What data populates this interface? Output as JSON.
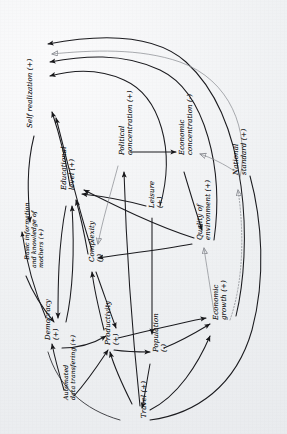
{
  "diagram": {
    "type": "causal-loop-diagram",
    "orientation": "labels rotated 90 degrees counter-clockwise",
    "ink_color": "#17171a",
    "paper_color": "#f1f2f4",
    "faint_ink_color": "#8e9096"
  },
  "nodes": [
    {
      "id": "self_realization",
      "label": "Self realization (+)",
      "polarity": "+",
      "x": 26,
      "y": 128
    },
    {
      "id": "basic_information",
      "label": "Basic information\nand knowledge of\nmothers (+)",
      "polarity": "+",
      "x": 16,
      "y": 268
    },
    {
      "id": "educational_level",
      "label": "Educational\nlevel (+)",
      "polarity": "+",
      "x": 60,
      "y": 190
    },
    {
      "id": "democracy",
      "label": "Democracy\n(+)",
      "polarity": "+",
      "x": 44,
      "y": 340
    },
    {
      "id": "automated_transfer",
      "label": "Automated\ndata transfering (+)",
      "polarity": "+",
      "x": 62,
      "y": 400
    },
    {
      "id": "complexity",
      "label": "Complexity\n(-)",
      "polarity": "-",
      "x": 88,
      "y": 262
    },
    {
      "id": "productivity",
      "label": "Productivity\n(+)",
      "polarity": "+",
      "x": 104,
      "y": 345
    },
    {
      "id": "political_conc",
      "label": "Political\nconcentration (+)",
      "polarity": "+",
      "x": 118,
      "y": 155
    },
    {
      "id": "leisure",
      "label": "Leisure\n(+)",
      "polarity": "+",
      "x": 148,
      "y": 208
    },
    {
      "id": "population",
      "label": "Population\n(-)",
      "polarity": "-",
      "x": 152,
      "y": 352
    },
    {
      "id": "travel",
      "label": "Travel (+)",
      "polarity": "+",
      "x": 140,
      "y": 418
    },
    {
      "id": "economic_conc",
      "label": "Economic\nconcentration (-)",
      "polarity": "-",
      "x": 178,
      "y": 155
    },
    {
      "id": "quality_env",
      "label": "Quality of\nenvironment (+)",
      "polarity": "+",
      "x": 196,
      "y": 240
    },
    {
      "id": "economic_growth",
      "label": "Economic\ngrowth (+)",
      "polarity": "+",
      "x": 212,
      "y": 320
    },
    {
      "id": "national_standard",
      "label": "National\nstandard (+)",
      "polarity": "+",
      "x": 232,
      "y": 175
    }
  ],
  "edges": [
    {
      "from": "educational_level",
      "to": "self_realization",
      "style": "solid"
    },
    {
      "from": "leisure",
      "to": "self_realization",
      "style": "solid"
    },
    {
      "from": "economic_growth",
      "to": "self_realization",
      "style": "solid"
    },
    {
      "from": "national_standard",
      "to": "self_realization",
      "style": "faint-open"
    },
    {
      "from": "quality_env",
      "to": "self_realization",
      "style": "solid"
    },
    {
      "from": "self_realization",
      "to": "basic_information",
      "style": "solid"
    },
    {
      "from": "basic_information",
      "to": "democracy",
      "style": "solid"
    },
    {
      "from": "educational_level",
      "to": "democracy",
      "style": "solid"
    },
    {
      "from": "democracy",
      "to": "educational_level",
      "style": "solid"
    },
    {
      "from": "automated_transfer",
      "to": "democracy",
      "style": "solid"
    },
    {
      "from": "automated_transfer",
      "to": "productivity",
      "style": "solid"
    },
    {
      "from": "democracy",
      "to": "productivity",
      "style": "solid"
    },
    {
      "from": "complexity",
      "to": "productivity",
      "style": "solid"
    },
    {
      "from": "productivity",
      "to": "complexity",
      "style": "solid"
    },
    {
      "from": "complexity",
      "to": "educational_level",
      "style": "solid"
    },
    {
      "from": "leisure",
      "to": "educational_level",
      "style": "solid"
    },
    {
      "from": "quality_env",
      "to": "complexity",
      "style": "solid"
    },
    {
      "from": "political_conc",
      "to": "economic_conc",
      "style": "solid"
    },
    {
      "from": "political_conc",
      "to": "complexity",
      "style": "faint-open"
    },
    {
      "from": "economic_conc",
      "to": "quality_env",
      "style": "solid"
    },
    {
      "from": "economic_growth",
      "to": "quality_env",
      "style": "faint-open"
    },
    {
      "from": "travel",
      "to": "political_conc",
      "style": "solid"
    },
    {
      "from": "travel",
      "to": "productivity",
      "style": "solid"
    },
    {
      "from": "travel",
      "to": "economic_growth",
      "style": "solid"
    },
    {
      "from": "productivity",
      "to": "population",
      "style": "solid"
    },
    {
      "from": "population",
      "to": "travel",
      "style": "solid"
    },
    {
      "from": "population",
      "to": "economic_growth",
      "style": "solid"
    },
    {
      "from": "economic_growth",
      "to": "national_standard",
      "style": "dotted-open"
    },
    {
      "from": "national_standard",
      "to": "economic_conc",
      "style": "faint-open"
    },
    {
      "from": "leisure",
      "to": "population",
      "style": "solid"
    },
    {
      "from": "productivity",
      "to": "economic_growth",
      "style": "solid"
    }
  ],
  "legend": {
    "positive_marker": "(+)",
    "negative_marker": "(-)"
  }
}
